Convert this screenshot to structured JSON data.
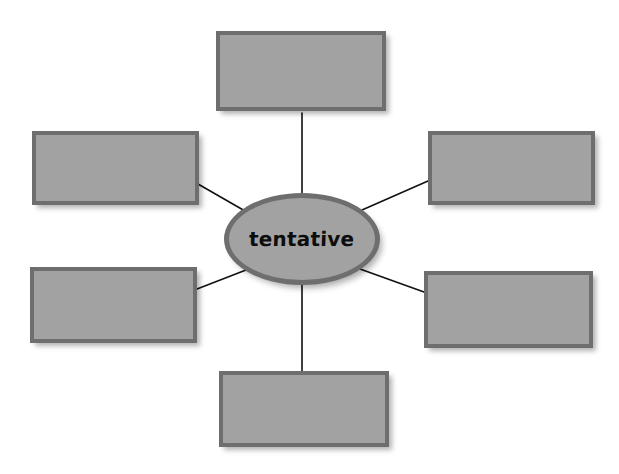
{
  "canvas": {
    "width": 619,
    "height": 474,
    "background_color": "#ffffff"
  },
  "diagram": {
    "type": "word-web",
    "title": "",
    "center": {
      "label": "tentative",
      "shape": "ellipse",
      "cx": 302,
      "cy": 239,
      "rx": 78,
      "ry": 46,
      "fill_color": "#a2a2a2",
      "border_color": "#6e6e6e"
    },
    "style": {
      "box_fill_color": "#a2a2a2",
      "box_border_color": "#6e6e6e",
      "connector_color": "#111111",
      "connector_width": 1.6,
      "text_color": "#0d0d0d"
    },
    "boxes": [
      {
        "id": "box-top",
        "label": "",
        "x": 216,
        "y": 31,
        "w": 170,
        "h": 80
      },
      {
        "id": "box-top-left",
        "x": 32,
        "y": 131,
        "w": 167,
        "h": 74,
        "label": ""
      },
      {
        "id": "box-top-right",
        "label": "",
        "x": 428,
        "y": 131,
        "w": 167,
        "h": 74
      },
      {
        "id": "box-bottom-left",
        "label": "",
        "x": 30,
        "y": 267,
        "w": 167,
        "h": 76
      },
      {
        "id": "box-bottom-right",
        "label": "",
        "x": 424,
        "y": 271,
        "w": 169,
        "h": 77
      },
      {
        "id": "box-bottom",
        "label": "",
        "x": 219,
        "y": 371,
        "w": 170,
        "h": 76
      }
    ],
    "connectors": [
      {
        "id": "link-top",
        "from": "center",
        "to": "box-top",
        "x1": 302,
        "y1": 193,
        "x2": 302,
        "y2": 113
      },
      {
        "id": "link-top-left",
        "from": "center",
        "to": "box-top-left",
        "x1": 245,
        "y1": 211,
        "x2": 198,
        "y2": 184
      },
      {
        "id": "link-top-right",
        "from": "center",
        "to": "box-top-right",
        "x1": 362,
        "y1": 210,
        "x2": 428,
        "y2": 181
      },
      {
        "id": "link-bottom-left",
        "from": "center",
        "to": "box-bottom-left",
        "x1": 246,
        "y1": 270,
        "x2": 197,
        "y2": 289
      },
      {
        "id": "link-bottom-right",
        "from": "center",
        "to": "box-bottom-right",
        "x1": 360,
        "y1": 269,
        "x2": 424,
        "y2": 292
      },
      {
        "id": "link-bottom",
        "from": "center",
        "to": "box-bottom",
        "x1": 302,
        "y1": 284,
        "x2": 302,
        "y2": 371
      }
    ]
  }
}
